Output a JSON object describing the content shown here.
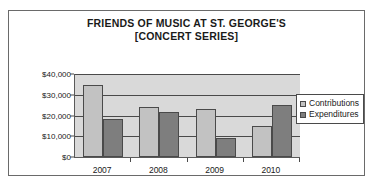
{
  "chart_data": {
    "type": "bar",
    "title": "FRIENDS OF MUSIC AT ST. GEORGE'S [CONCERT SERIES]",
    "title_lines": [
      "FRIENDS OF MUSIC AT ST. GEORGE'S",
      "[CONCERT SERIES]"
    ],
    "categories": [
      "2007",
      "2008",
      "2009",
      "2010"
    ],
    "series": [
      {
        "name": "Contributions",
        "values": [
          34500,
          24000,
          23000,
          15000
        ],
        "color": "#c2c2c2"
      },
      {
        "name": "Expenditures",
        "values": [
          18500,
          21500,
          9000,
          25000
        ],
        "color": "#7e7e7e"
      }
    ],
    "xlabel": "",
    "ylabel": "",
    "ylim": [
      0,
      40000
    ],
    "ytick_values": [
      0,
      10000,
      20000,
      30000,
      40000
    ],
    "ytick_labels": [
      "$0",
      "$10,000",
      "$20,000",
      "$30,000",
      "$40,000"
    ],
    "grid": true,
    "legend_position": "right",
    "plot_background": "#d9d9d9",
    "axis_color": "#4a4a4a"
  }
}
